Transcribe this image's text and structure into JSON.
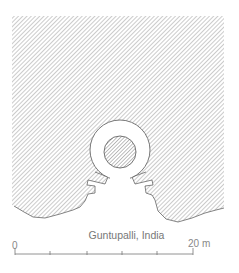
{
  "figure": {
    "caption": "Guntupalli, India",
    "scale_bar": {
      "start_label": "0",
      "end_label": "20 m",
      "ticks": 6
    },
    "colors": {
      "hatch": "#9a9a9a",
      "outline": "#666666",
      "background": "#ffffff"
    }
  }
}
